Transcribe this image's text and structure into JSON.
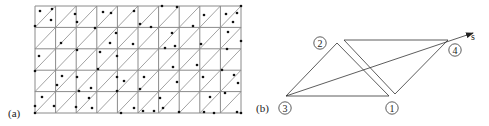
{
  "panel_a": {
    "label": "(a)",
    "grid": {
      "left": 35,
      "right": 241,
      "top": 6,
      "bottom": 113,
      "cols": 10,
      "rows": 5,
      "x_lines": [
        35,
        55.6,
        76.2,
        96.8,
        117.4,
        138,
        158.6,
        179.2,
        199.8,
        220.4,
        241
      ],
      "y_lines": [
        6,
        27.4,
        48.8,
        70.2,
        91.6,
        113
      ],
      "diagonal_direction": "bottom-left to top-right in every cell",
      "line_color": "#8a8a8a"
    },
    "points": [
      [
        40,
        11
      ],
      [
        52,
        9
      ],
      [
        51,
        20
      ],
      [
        35,
        26
      ],
      [
        75,
        14
      ],
      [
        77,
        22
      ],
      [
        103,
        12
      ],
      [
        111,
        13
      ],
      [
        134,
        11
      ],
      [
        162,
        6
      ],
      [
        177,
        7
      ],
      [
        204,
        15
      ],
      [
        226,
        14
      ],
      [
        237,
        13
      ],
      [
        233,
        22
      ],
      [
        241,
        6
      ],
      [
        193,
        26
      ],
      [
        151,
        27
      ],
      [
        140,
        24
      ],
      [
        95,
        28
      ],
      [
        61,
        43
      ],
      [
        116,
        33
      ],
      [
        110,
        43
      ],
      [
        133,
        44
      ],
      [
        172,
        33
      ],
      [
        175,
        46
      ],
      [
        165,
        48
      ],
      [
        201,
        44
      ],
      [
        228,
        32
      ],
      [
        241,
        41
      ],
      [
        39,
        56
      ],
      [
        77,
        50
      ],
      [
        100,
        52
      ],
      [
        117,
        56
      ],
      [
        197,
        65
      ],
      [
        173,
        67
      ],
      [
        227,
        49
      ],
      [
        222,
        70
      ],
      [
        98,
        69
      ],
      [
        35,
        71
      ],
      [
        62,
        76
      ],
      [
        57,
        85
      ],
      [
        77,
        77
      ],
      [
        117,
        77
      ],
      [
        124,
        81
      ],
      [
        144,
        77
      ],
      [
        177,
        82
      ],
      [
        140,
        89
      ],
      [
        203,
        77
      ],
      [
        234,
        75
      ],
      [
        238,
        83
      ],
      [
        91,
        88
      ],
      [
        79,
        91
      ],
      [
        117,
        91
      ],
      [
        42,
        97
      ],
      [
        35,
        106
      ],
      [
        54,
        106
      ],
      [
        89,
        98
      ],
      [
        92,
        108
      ],
      [
        76,
        107
      ],
      [
        134,
        108
      ],
      [
        160,
        98
      ],
      [
        163,
        108
      ],
      [
        143,
        111
      ],
      [
        154,
        111
      ],
      [
        121,
        113
      ],
      [
        179,
        112
      ],
      [
        204,
        112
      ],
      [
        214,
        113
      ],
      [
        210,
        97
      ],
      [
        225,
        93
      ],
      [
        237,
        112
      ],
      [
        241,
        113
      ],
      [
        35,
        113
      ]
    ],
    "point_color": "#111111"
  },
  "panel_b": {
    "label": "(b)",
    "triangles": [
      {
        "name": "triangle-3-2-1",
        "points": [
          [
            286,
            96
          ],
          [
            337,
            43
          ],
          [
            389,
            96
          ]
        ]
      },
      {
        "name": "triangle-top-4-bottom",
        "points": [
          [
            344,
            40
          ],
          [
            448,
            40
          ],
          [
            395,
            94
          ]
        ]
      }
    ],
    "arrow": {
      "from": [
        286,
        96
      ],
      "to": [
        473,
        33
      ],
      "label": "s",
      "label_pos": [
        471,
        40
      ]
    },
    "nodes": [
      {
        "id": "1",
        "label": "1",
        "cx": 392,
        "cy": 108
      },
      {
        "id": "2",
        "label": "2",
        "cx": 320,
        "cy": 43
      },
      {
        "id": "3",
        "label": "3",
        "cx": 285,
        "cy": 108
      },
      {
        "id": "4",
        "label": "4",
        "cx": 455,
        "cy": 50
      }
    ],
    "line_color": "#333333"
  }
}
